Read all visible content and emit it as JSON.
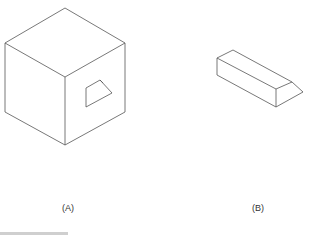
{
  "figure": {
    "labels": {
      "a": "(A)",
      "b": "(B)"
    },
    "colors": {
      "stroke": "#555555",
      "background": "#ffffff"
    },
    "shapes": [
      {
        "id": "A",
        "description": "isometric cube with trapezoidal opening on right face"
      },
      {
        "id": "B",
        "description": "isometric rectangular bar with beveled end"
      }
    ]
  }
}
